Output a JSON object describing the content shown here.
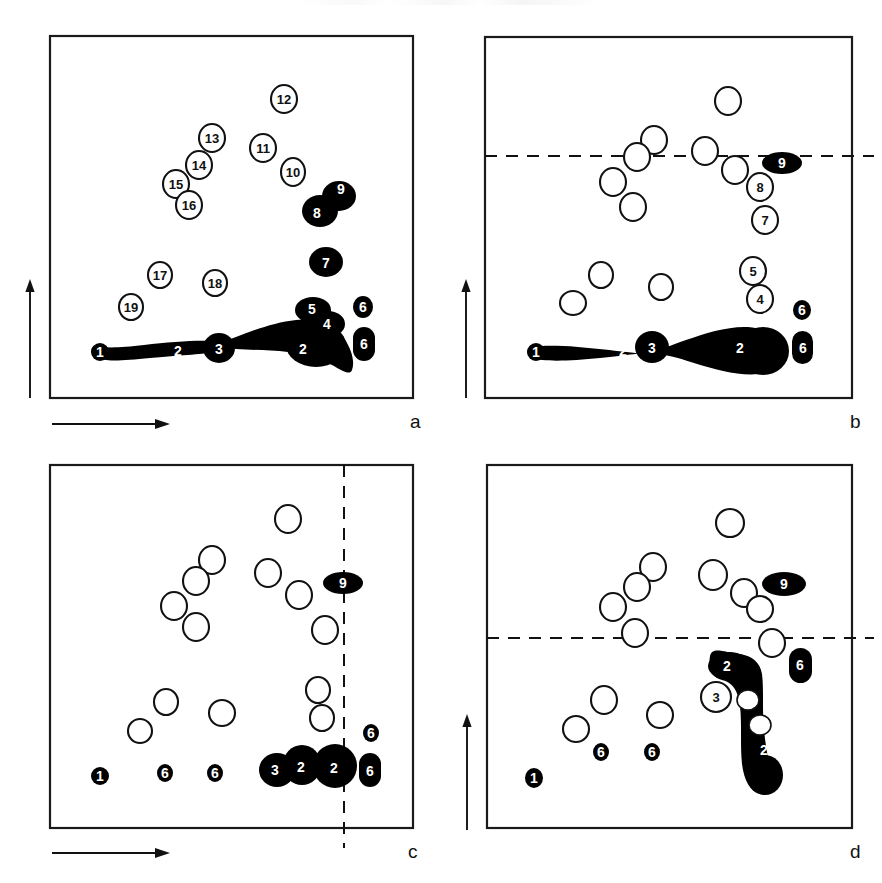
{
  "figure": {
    "type": "scatter-schematic",
    "panel_count": 4,
    "colors": {
      "ink": "#111111",
      "filled": "#000000",
      "open": "#ffffff",
      "frame": "#1a1a1a",
      "page": "#ffffff"
    }
  },
  "panels": [
    {
      "id": "a",
      "label": "a",
      "frame": {
        "x": 50,
        "y": 36,
        "w": 363,
        "h": 362
      },
      "dashed_line": null,
      "axes": [
        {
          "name": "y-axis-arrow",
          "orientation": "vertical",
          "x": 30,
          "y1": 398,
          "y2": 283
        },
        {
          "name": "x-axis-arrow",
          "orientation": "horizontal",
          "y": 424,
          "x1": 52,
          "x2": 168
        }
      ],
      "open_blobs": [
        {
          "n": "12",
          "cx": 284,
          "cy": 99,
          "rx": 13,
          "ry": 14
        },
        {
          "n": "13",
          "cx": 212,
          "cy": 138,
          "rx": 13,
          "ry": 14
        },
        {
          "n": "11",
          "cx": 263,
          "cy": 148,
          "rx": 13,
          "ry": 14
        },
        {
          "n": "14",
          "cx": 199,
          "cy": 165,
          "rx": 13,
          "ry": 14
        },
        {
          "n": "10",
          "cx": 293,
          "cy": 172,
          "rx": 12,
          "ry": 14
        },
        {
          "n": "15",
          "cx": 176,
          "cy": 184,
          "rx": 13,
          "ry": 14
        },
        {
          "n": "16",
          "cx": 189,
          "cy": 205,
          "rx": 13,
          "ry": 14
        },
        {
          "n": "17",
          "cx": 160,
          "cy": 275,
          "rx": 12,
          "ry": 13
        },
        {
          "n": "18",
          "cx": 215,
          "cy": 283,
          "rx": 12,
          "ry": 13
        },
        {
          "n": "19",
          "cx": 131,
          "cy": 307,
          "rx": 12,
          "ry": 13
        }
      ],
      "filled_blobs": [
        {
          "n": "9",
          "cx": 338,
          "cy": 196,
          "rx": 16,
          "ry": 14
        },
        {
          "n": "8",
          "cx": 320,
          "cy": 211,
          "rx": 17,
          "ry": 15
        },
        {
          "n": "7",
          "cx": 326,
          "cy": 262,
          "rx": 16,
          "ry": 14
        },
        {
          "n": "5",
          "cx": 313,
          "cy": 310,
          "rx": 16,
          "ry": 13
        },
        {
          "n": "4",
          "cx": 325,
          "cy": 324,
          "rx": 15,
          "ry": 13
        },
        {
          "n": "6",
          "cx": 363,
          "cy": 307,
          "rx": 10,
          "ry": 11
        },
        {
          "n": "6",
          "cx": 364,
          "cy": 343,
          "rx": 11,
          "ry": 17
        },
        {
          "n": "1",
          "cx": 100,
          "cy": 352,
          "rx": 8,
          "ry": 8
        },
        {
          "n": "2",
          "cx": 178,
          "cy": 351,
          "rx": 0,
          "ry": 0
        },
        {
          "n": "3",
          "cx": 219,
          "cy": 348,
          "rx": 15,
          "ry": 14
        },
        {
          "n": "2",
          "cx": 307,
          "cy": 349,
          "rx": 0,
          "ry": 0
        }
      ],
      "tail_note": "long tapering black tail from blob 1 through 2, 3 widening to large mass at 2 with 4/5 lobes on top"
    },
    {
      "id": "b",
      "label": "b",
      "frame": {
        "x": 485,
        "y": 37,
        "w": 367,
        "h": 361
      },
      "dashed_line": {
        "orientation": "horizontal",
        "y": 156,
        "x1": 485,
        "x2": 874
      },
      "axes": [
        {
          "name": "y-axis-arrow",
          "orientation": "vertical",
          "x": 466,
          "y1": 398,
          "y2": 283
        }
      ],
      "open_blobs": [
        {
          "n": "",
          "cx": 728,
          "cy": 101,
          "rx": 13,
          "ry": 14
        },
        {
          "n": "",
          "cx": 654,
          "cy": 140,
          "rx": 13,
          "ry": 14
        },
        {
          "n": "",
          "cx": 705,
          "cy": 151,
          "rx": 13,
          "ry": 14
        },
        {
          "n": "",
          "cx": 637,
          "cy": 157,
          "rx": 13,
          "ry": 14
        },
        {
          "n": "",
          "cx": 735,
          "cy": 170,
          "rx": 13,
          "ry": 14
        },
        {
          "n": "",
          "cx": 613,
          "cy": 182,
          "rx": 13,
          "ry": 14
        },
        {
          "n": "",
          "cx": 633,
          "cy": 207,
          "rx": 13,
          "ry": 14
        },
        {
          "n": "8",
          "cx": 760,
          "cy": 187,
          "rx": 13,
          "ry": 14
        },
        {
          "n": "7",
          "cx": 765,
          "cy": 220,
          "rx": 13,
          "ry": 14
        },
        {
          "n": "",
          "cx": 601,
          "cy": 275,
          "rx": 12,
          "ry": 13
        },
        {
          "n": "",
          "cx": 661,
          "cy": 287,
          "rx": 12,
          "ry": 13
        },
        {
          "n": "",
          "cx": 573,
          "cy": 303,
          "rx": 13,
          "ry": 12
        },
        {
          "n": "5",
          "cx": 753,
          "cy": 271,
          "rx": 13,
          "ry": 14
        },
        {
          "n": "4",
          "cx": 760,
          "cy": 299,
          "rx": 13,
          "ry": 14
        }
      ],
      "filled_blobs": [
        {
          "n": "9",
          "cx": 782,
          "cy": 163,
          "rx": 19,
          "ry": 10
        },
        {
          "n": "6",
          "cx": 802,
          "cy": 310,
          "rx": 9,
          "ry": 10
        },
        {
          "n": "6",
          "cx": 803,
          "cy": 347,
          "rx": 10,
          "ry": 16
        },
        {
          "n": "1",
          "cx": 536,
          "cy": 352,
          "rx": 8,
          "ry": 8
        },
        {
          "n": "2",
          "cx": 623,
          "cy": 351,
          "rx": 0,
          "ry": 0
        },
        {
          "n": "3",
          "cx": 652,
          "cy": 347,
          "rx": 15,
          "ry": 15
        },
        {
          "n": "2",
          "cx": 740,
          "cy": 348,
          "rx": 0,
          "ry": 0
        }
      ],
      "tail_note": "long tapering black tail from 1 through 2, bulge at 3, widening to large rounded mass at 2"
    },
    {
      "id": "c",
      "label": "c",
      "frame": {
        "x": 50,
        "y": 465,
        "w": 363,
        "h": 363
      },
      "dashed_line": {
        "orientation": "vertical",
        "x": 344,
        "y1": 465,
        "y2": 837
      },
      "axes": [
        {
          "name": "x-axis-arrow",
          "orientation": "horizontal",
          "y": 853,
          "x1": 52,
          "x2": 168
        }
      ],
      "open_blobs": [
        {
          "n": "",
          "cx": 288,
          "cy": 519,
          "rx": 13,
          "ry": 14
        },
        {
          "n": "",
          "cx": 212,
          "cy": 560,
          "rx": 13,
          "ry": 14
        },
        {
          "n": "",
          "cx": 268,
          "cy": 573,
          "rx": 13,
          "ry": 14
        },
        {
          "n": "",
          "cx": 196,
          "cy": 581,
          "rx": 13,
          "ry": 14
        },
        {
          "n": "",
          "cx": 299,
          "cy": 595,
          "rx": 13,
          "ry": 14
        },
        {
          "n": "",
          "cx": 174,
          "cy": 606,
          "rx": 13,
          "ry": 14
        },
        {
          "n": "",
          "cx": 196,
          "cy": 627,
          "rx": 13,
          "ry": 14
        },
        {
          "n": "",
          "cx": 325,
          "cy": 630,
          "rx": 13,
          "ry": 14
        },
        {
          "n": "",
          "cx": 166,
          "cy": 702,
          "rx": 12,
          "ry": 13
        },
        {
          "n": "",
          "cx": 222,
          "cy": 713,
          "rx": 13,
          "ry": 13
        },
        {
          "n": "",
          "cx": 140,
          "cy": 731,
          "rx": 12,
          "ry": 12
        },
        {
          "n": "",
          "cx": 318,
          "cy": 690,
          "rx": 12,
          "ry": 13
        },
        {
          "n": "",
          "cx": 322,
          "cy": 718,
          "rx": 12,
          "ry": 13
        }
      ],
      "filled_blobs": [
        {
          "n": "9",
          "cx": 343,
          "cy": 583,
          "rx": 19,
          "ry": 10
        },
        {
          "n": "6",
          "cx": 371,
          "cy": 733,
          "rx": 8,
          "ry": 9
        },
        {
          "n": "3",
          "cx": 277,
          "cy": 770,
          "rx": 17,
          "ry": 16
        },
        {
          "n": "2",
          "cx": 302,
          "cy": 765,
          "rx": 18,
          "ry": 19
        },
        {
          "n": "2",
          "cx": 334,
          "cy": 766,
          "rx": 21,
          "ry": 21
        },
        {
          "n": "6",
          "cx": 370,
          "cy": 770,
          "rx": 11,
          "ry": 17
        },
        {
          "n": "1",
          "cx": 100,
          "cy": 776,
          "rx": 8,
          "ry": 8
        },
        {
          "n": "6",
          "cx": 165,
          "cy": 773,
          "rx": 8,
          "ry": 9
        },
        {
          "n": "6",
          "cx": 215,
          "cy": 773,
          "rx": 8,
          "ry": 9
        }
      ],
      "tail_note": "no connecting tail; discrete dots along the lower baseline"
    },
    {
      "id": "d",
      "label": "d",
      "frame": {
        "x": 487,
        "y": 465,
        "w": 365,
        "h": 363
      },
      "dashed_line": {
        "orientation": "horizontal",
        "y": 638,
        "x1": 487,
        "x2": 874
      },
      "axes": [
        {
          "name": "y-axis-arrow",
          "orientation": "vertical",
          "x": 467,
          "y1": 830,
          "y2": 718
        }
      ],
      "open_blobs": [
        {
          "n": "",
          "cx": 730,
          "cy": 523,
          "rx": 14,
          "ry": 14
        },
        {
          "n": "",
          "cx": 653,
          "cy": 567,
          "rx": 13,
          "ry": 14
        },
        {
          "n": "",
          "cx": 713,
          "cy": 575,
          "rx": 14,
          "ry": 15
        },
        {
          "n": "",
          "cx": 637,
          "cy": 587,
          "rx": 13,
          "ry": 14
        },
        {
          "n": "",
          "cx": 744,
          "cy": 593,
          "rx": 13,
          "ry": 14
        },
        {
          "n": "",
          "cx": 613,
          "cy": 607,
          "rx": 13,
          "ry": 14
        },
        {
          "n": "",
          "cx": 760,
          "cy": 609,
          "rx": 13,
          "ry": 13
        },
        {
          "n": "",
          "cx": 635,
          "cy": 633,
          "rx": 13,
          "ry": 14
        },
        {
          "n": "",
          "cx": 772,
          "cy": 643,
          "rx": 13,
          "ry": 14
        },
        {
          "n": "3",
          "cx": 716,
          "cy": 697,
          "rx": 15,
          "ry": 15
        },
        {
          "n": "",
          "cx": 748,
          "cy": 700,
          "rx": 11,
          "ry": 10
        },
        {
          "n": "",
          "cx": 760,
          "cy": 725,
          "rx": 11,
          "ry": 10
        },
        {
          "n": "",
          "cx": 604,
          "cy": 700,
          "rx": 13,
          "ry": 14
        },
        {
          "n": "",
          "cx": 660,
          "cy": 715,
          "rx": 13,
          "ry": 13
        },
        {
          "n": "",
          "cx": 576,
          "cy": 729,
          "rx": 13,
          "ry": 13
        }
      ],
      "filled_blobs": [
        {
          "n": "9",
          "cx": 784,
          "cy": 584,
          "rx": 21,
          "ry": 12
        },
        {
          "n": "2",
          "cx": 729,
          "cy": 666,
          "rx": 20,
          "ry": 13
        },
        {
          "n": "6",
          "cx": 800,
          "cy": 665,
          "rx": 12,
          "ry": 17
        },
        {
          "n": "2",
          "cx": 767,
          "cy": 750,
          "rx": 0,
          "ry": 0
        },
        {
          "n": "1",
          "cx": 534,
          "cy": 778,
          "rx": 8,
          "ry": 9
        },
        {
          "n": "6",
          "cx": 601,
          "cy": 752,
          "rx": 8,
          "ry": 9
        },
        {
          "n": "6",
          "cx": 652,
          "cy": 752,
          "rx": 8,
          "ry": 9
        }
      ],
      "tail_note": "hooked / L-shaped black mass running from blob 2 (upper-left) down and right through 2 (lower), pierced by two white open circles"
    }
  ]
}
